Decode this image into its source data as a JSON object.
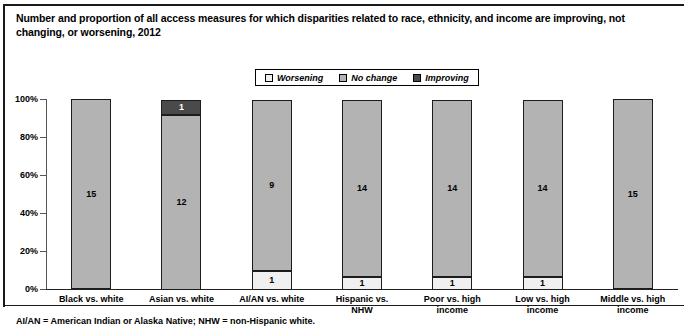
{
  "title": "Number and proportion of all access measures for which disparities related to race, ethnicity, and income are improving, not changing, or worsening, 2012",
  "footnote": "AI/AN = American Indian or Alaska Native; NHW = non-Hispanic white.",
  "legend": {
    "items": [
      {
        "label": "Worsening",
        "color": "#f0f0f0"
      },
      {
        "label": "No change",
        "color": "#b3b3b3"
      },
      {
        "label": "Improving",
        "color": "#4a4a4a"
      }
    ]
  },
  "chart_data": {
    "type": "bar",
    "title": "Number and proportion of all access measures for which disparities related to race, ethnicity, and income are improving, not changing, or worsening, 2012",
    "subtitle": "",
    "xlabel": "",
    "ylabel": "",
    "stacked": true,
    "stack_mode": "percent",
    "grid": false,
    "legend_position": "top-center",
    "ylim": [
      0,
      100
    ],
    "yticks": [
      "0%",
      "20%",
      "40%",
      "60%",
      "80%",
      "100%"
    ],
    "ytick_values": [
      0,
      20,
      40,
      60,
      80,
      100
    ],
    "categories": [
      "Black vs. white",
      "Asian vs. white",
      "AI/AN vs. white",
      "Hispanic vs. NHW",
      "Poor vs. high income",
      "Low vs. high income",
      "Middle vs. high income"
    ],
    "category_lines": [
      [
        "Black vs. white"
      ],
      [
        "Asian vs. white"
      ],
      [
        "AI/AN vs. white"
      ],
      [
        "Hispanic vs.",
        "NHW"
      ],
      [
        "Poor vs. high",
        "income"
      ],
      [
        "Low vs. high",
        "income"
      ],
      [
        "Middle vs. high",
        "income"
      ]
    ],
    "series": [
      {
        "name": "Worsening",
        "color": "#f0f0f0",
        "values": [
          0,
          0,
          1,
          1,
          1,
          1,
          0
        ]
      },
      {
        "name": "No change",
        "color": "#b3b3b3",
        "values": [
          15,
          12,
          9,
          14,
          14,
          14,
          15
        ]
      },
      {
        "name": "Improving",
        "color": "#4a4a4a",
        "values": [
          0,
          1,
          0,
          0,
          0,
          0,
          0
        ]
      }
    ],
    "totals": [
      15,
      13,
      10,
      15,
      15,
      15,
      15
    ],
    "bar_labels": [
      [
        {
          "series": "No change",
          "text": "15"
        }
      ],
      [
        {
          "series": "No change",
          "text": "12"
        },
        {
          "series": "Improving",
          "text": "1"
        }
      ],
      [
        {
          "series": "Worsening",
          "text": "1"
        },
        {
          "series": "No change",
          "text": "9"
        }
      ],
      [
        {
          "series": "Worsening",
          "text": "1"
        },
        {
          "series": "No change",
          "text": "14"
        }
      ],
      [
        {
          "series": "Worsening",
          "text": "1"
        },
        {
          "series": "No change",
          "text": "14"
        }
      ],
      [
        {
          "series": "Worsening",
          "text": "1"
        },
        {
          "series": "No change",
          "text": "14"
        }
      ],
      [
        {
          "series": "No change",
          "text": "15"
        }
      ]
    ]
  }
}
